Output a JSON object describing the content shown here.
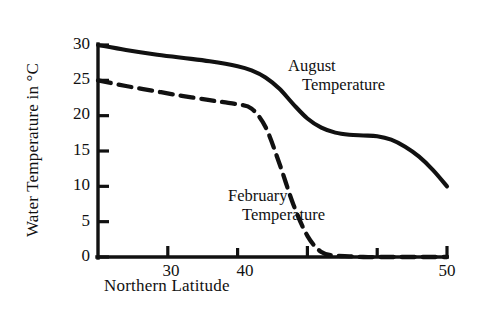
{
  "chart_data": {
    "type": "line",
    "title": "",
    "xlabel": "Northern Latitude",
    "ylabel": "Water Temperature in °C",
    "xlim": [
      25,
      50
    ],
    "ylim": [
      0,
      30
    ],
    "xticks": [
      30,
      40,
      50
    ],
    "xtick_labels": [
      "30",
      "40",
      "50"
    ],
    "xminor_ticks": [
      35,
      45
    ],
    "yticks": [
      0,
      5,
      10,
      15,
      20,
      25,
      30
    ],
    "ytick_labels": [
      "0",
      "5",
      "10",
      "15",
      "20",
      "25",
      "30"
    ],
    "grid": false,
    "legend": "inline-annotations",
    "series": [
      {
        "name": "August Temperature",
        "style": "solid",
        "color": "#111111",
        "x": [
          25,
          27,
          29,
          31,
          33,
          35,
          36,
          37,
          38,
          39,
          40,
          41,
          42,
          43,
          44,
          45,
          46,
          47,
          48,
          49,
          50
        ],
        "values": [
          30.0,
          29.3,
          28.7,
          28.2,
          27.7,
          27.0,
          26.4,
          25.4,
          23.8,
          21.6,
          19.6,
          18.3,
          17.6,
          17.3,
          17.2,
          17.1,
          16.6,
          15.6,
          14.2,
          12.3,
          10.0
        ]
      },
      {
        "name": "February Temperature",
        "style": "dashed",
        "color": "#111111",
        "x": [
          25,
          27,
          29,
          31,
          33,
          34,
          35,
          36,
          37,
          38,
          39,
          40,
          41,
          42,
          43,
          44,
          45,
          46,
          47,
          48,
          49,
          50
        ],
        "values": [
          25.0,
          24.2,
          23.5,
          22.8,
          22.2,
          21.9,
          21.6,
          21.0,
          18.4,
          13.2,
          7.4,
          3.0,
          0.7,
          0.2,
          0.1,
          0.0,
          0.0,
          0.0,
          0.0,
          0.0,
          0.0,
          0.0
        ]
      }
    ],
    "annotations": [
      {
        "name": "august-annotation",
        "line1": "August",
        "line2": "Temperature"
      },
      {
        "name": "february-annotation",
        "line1": "February",
        "line2": "Temperature"
      }
    ]
  },
  "axis": {
    "y_title": "Water Temperature in °C",
    "x_title": "Northern Latitude"
  },
  "labels": {
    "august_line1": "August",
    "august_line2": "Temperature",
    "february_line1": "February",
    "february_line2": "Temperature"
  },
  "yticks": {
    "t0": "0",
    "t5": "5",
    "t10": "10",
    "t15": "15",
    "t20": "20",
    "t25": "25",
    "t30": "30"
  },
  "xticks": {
    "t30": "30",
    "t40": "40",
    "t50": "50"
  },
  "style": {
    "ink": "#111111",
    "background": "#ffffff"
  }
}
